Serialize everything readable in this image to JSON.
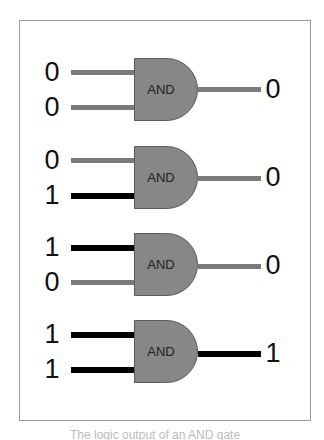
{
  "diagram": {
    "colors": {
      "low_wire": "#7a7a7a",
      "high_wire": "#000000",
      "gate_fill": "#878787",
      "frame_border": "#9a9a9a"
    },
    "gates": [
      {
        "name": "AND",
        "inputs": [
          "0",
          "0"
        ],
        "output": "0"
      },
      {
        "name": "AND",
        "inputs": [
          "0",
          "1"
        ],
        "output": "0"
      },
      {
        "name": "AND",
        "inputs": [
          "1",
          "0"
        ],
        "output": "0"
      },
      {
        "name": "AND",
        "inputs": [
          "1",
          "1"
        ],
        "output": "1"
      }
    ],
    "caption": "The logic output of an AND gate"
  }
}
